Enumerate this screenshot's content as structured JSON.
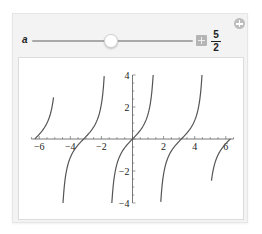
{
  "manipulate": {
    "add_button_icon": "plus-circle-icon",
    "control": {
      "variable_label": "a",
      "value_numerator": "5",
      "value_denominator": "2",
      "value": 2.5,
      "expand_icon": "plus-box-icon"
    }
  },
  "chart_data": {
    "type": "line",
    "function": "tan(x)",
    "title": "",
    "xlabel": "",
    "ylabel": "",
    "xlim": [
      -6.5,
      6.5
    ],
    "ylim": [
      -4,
      4
    ],
    "x_ticks": [
      "-6",
      "-4",
      "-2",
      "2",
      "4",
      "6"
    ],
    "x_tick_values": [
      -6,
      -4,
      -2,
      2,
      4,
      6
    ],
    "y_ticks": [
      "-4",
      "-2",
      "2",
      "4"
    ],
    "y_tick_values": [
      -4,
      -2,
      2,
      4
    ],
    "grid": false,
    "line_color": "#555555",
    "branches": [
      {
        "x_start": -6.28,
        "x_end": -5.08
      },
      {
        "x_start": -4.47,
        "x_end": -1.82
      },
      {
        "x_start": -1.33,
        "x_end": 1.33
      },
      {
        "x_start": 1.82,
        "x_end": 4.47
      },
      {
        "x_start": 5.08,
        "x_end": 6.3
      }
    ]
  }
}
